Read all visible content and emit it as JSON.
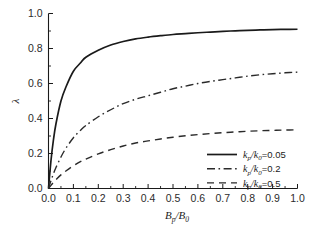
{
  "chart_data": {
    "type": "line",
    "title": "",
    "xlabel": "Bp/B0",
    "ylabel": "λ",
    "xlim": [
      0.0,
      1.0
    ],
    "ylim": [
      0.0,
      1.0
    ],
    "grid": false,
    "legend_position": "lower-right",
    "x_ticks": [
      "0.0",
      "0.1",
      "0.2",
      "0.3",
      "0.4",
      "0.5",
      "0.6",
      "0.7",
      "0.8",
      "0.9",
      "1.0"
    ],
    "x_tick_values": [
      0.0,
      0.1,
      0.2,
      0.3,
      0.4,
      0.5,
      0.6,
      0.7,
      0.8,
      0.9,
      1.0
    ],
    "y_ticks": [
      "0.0",
      "0.2",
      "0.4",
      "0.6",
      "0.8",
      "1.0"
    ],
    "y_tick_values": [
      0.0,
      0.2,
      0.4,
      0.6,
      0.8,
      1.0
    ],
    "x": [
      0.0,
      0.01,
      0.02,
      0.03,
      0.05,
      0.07,
      0.1,
      0.13,
      0.15,
      0.2,
      0.25,
      0.3,
      0.35,
      0.4,
      0.45,
      0.5,
      0.55,
      0.6,
      0.65,
      0.7,
      0.75,
      0.8,
      0.85,
      0.9,
      0.95,
      1.0
    ],
    "series": [
      {
        "name": "kp/k0=0.05",
        "style": "solid",
        "color": "#1a1a1a",
        "values": [
          0.0,
          0.16,
          0.28,
          0.37,
          0.5,
          0.58,
          0.67,
          0.72,
          0.75,
          0.79,
          0.82,
          0.84,
          0.855,
          0.865,
          0.873,
          0.88,
          0.885,
          0.89,
          0.894,
          0.898,
          0.901,
          0.904,
          0.906,
          0.908,
          0.909,
          0.91
        ]
      },
      {
        "name": "kp/k0=0.2",
        "style": "dashdot",
        "color": "#2a2a2a",
        "values": [
          0.0,
          0.045,
          0.085,
          0.12,
          0.18,
          0.23,
          0.29,
          0.335,
          0.36,
          0.41,
          0.45,
          0.485,
          0.51,
          0.53,
          0.55,
          0.57,
          0.585,
          0.6,
          0.612,
          0.622,
          0.632,
          0.642,
          0.65,
          0.656,
          0.661,
          0.665
        ]
      },
      {
        "name": "kp/k0=0.5",
        "style": "dashed",
        "color": "#2a2a2a",
        "values": [
          0.0,
          0.018,
          0.035,
          0.05,
          0.078,
          0.1,
          0.13,
          0.155,
          0.168,
          0.198,
          0.222,
          0.243,
          0.26,
          0.272,
          0.283,
          0.293,
          0.301,
          0.308,
          0.314,
          0.319,
          0.323,
          0.327,
          0.33,
          0.332,
          0.334,
          0.335
        ]
      }
    ],
    "legend_entries": [
      {
        "symbol_base": "k",
        "symbol_sub": "p",
        "denom_base": "k",
        "denom_sub": "0",
        "value": "=0.05",
        "style": "solid"
      },
      {
        "symbol_base": "k",
        "symbol_sub": "p",
        "denom_base": "k",
        "denom_sub": "0",
        "value": "=0.2",
        "style": "dashdot"
      },
      {
        "symbol_base": "k",
        "symbol_sub": "p",
        "denom_base": "k",
        "denom_sub": "0",
        "value": "=0.5",
        "style": "dashed"
      }
    ],
    "xlabel_parts": {
      "num_base": "B",
      "num_sub": "p",
      "slash": "/",
      "den_base": "B",
      "den_sub": "0"
    },
    "ylabel_text": "λ",
    "axis_color": "#1a1a1a",
    "background": "#ffffff"
  }
}
